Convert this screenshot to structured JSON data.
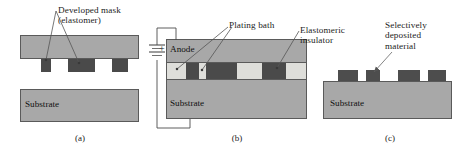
{
  "figure": {
    "background": "#ffffff",
    "colors": {
      "slab_gray": "#a8a8a8",
      "substrate_gray": "#a8a8a8",
      "mask_dark": "#4a4a4a",
      "bath_light": "#dededa",
      "outline": "#4d4d4d",
      "leader": "#555555",
      "text": "#1d1d1d"
    }
  },
  "panels": [
    {
      "id": "a",
      "caption": "(a)",
      "labels": [
        {
          "name": "developed-mask-label",
          "text": "Developed mask\n(elastomer)"
        }
      ],
      "inner_labels": [
        {
          "name": "substrate-label-a",
          "text": "Substrate"
        }
      ],
      "elements": {
        "elastomer_slab": "elastomer-slab",
        "mask_blocks_count": 3,
        "substrate": "substrate-block-a"
      }
    },
    {
      "id": "b",
      "caption": "(b)",
      "labels": [
        {
          "name": "plating-bath-label",
          "text": "Plating bath"
        }
      ],
      "inner_labels": [
        {
          "name": "anode-label",
          "text": "Anode"
        },
        {
          "name": "substrate-label-b",
          "text": "Substrate"
        }
      ],
      "circuit": {
        "polarity_sign": "+",
        "battery": "battery-symbol",
        "wire": "circuit-wire"
      },
      "elements": {
        "anode_block": "anode-block",
        "bath_stripe": "plating-bath-stripe",
        "insulator_blocks_count": 3,
        "bath_gaps_count": 4,
        "substrate": "substrate-block-b"
      }
    },
    {
      "id": "c",
      "caption": "(c)",
      "labels": [
        {
          "name": "elastomeric-insulator-label",
          "text": "Elastomeric\ninsulator"
        },
        {
          "name": "selectively-deposited-label",
          "text": "Selectively\ndeposited\nmaterial"
        }
      ],
      "inner_labels": [
        {
          "name": "substrate-label-c",
          "text": "Substrate"
        }
      ],
      "elements": {
        "deposit_blocks_count": 4,
        "substrate": "substrate-block-c"
      }
    }
  ]
}
